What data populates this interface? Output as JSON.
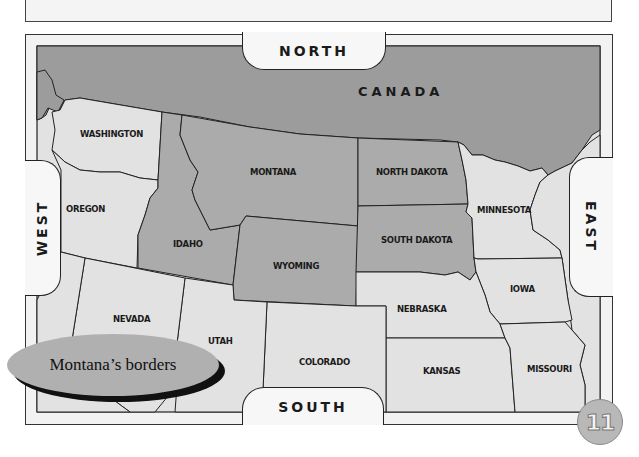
{
  "directions": {
    "north": "NORTH",
    "south": "SOUTH",
    "east": "EAST",
    "west": "WEST"
  },
  "country": "CANADA",
  "states": {
    "washington": "WASHINGTON",
    "oregon": "OREGON",
    "idaho": "IDAHO",
    "montana": "MONTANA",
    "wyoming": "WYOMING",
    "north_dakota": "NORTH DAKOTA",
    "south_dakota": "SOUTH DAKOTA",
    "minnesota": "MINNESOTA",
    "iowa": "IOWA",
    "nebraska": "NEBRASKA",
    "kansas": "KANSAS",
    "missouri": "MISSOURI",
    "nevada": "NEVADA",
    "utah": "UTAH",
    "colorado": "COLORADO"
  },
  "caption": "Montana’s borders",
  "page_number": "11",
  "colors": {
    "canada": "#9c9c9c",
    "highlighted_state": "#ababab",
    "other_state": "#e2e2e2",
    "frame": "#f2f2f2"
  }
}
